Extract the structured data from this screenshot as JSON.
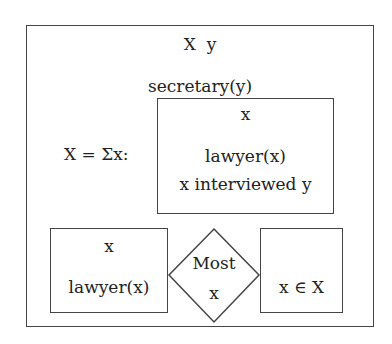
{
  "drs": {
    "universe": "X  y",
    "condition_secretary": "secretary(y)",
    "sum_label": "X = Σx:",
    "inner_box": {
      "universe": "x",
      "conditions": [
        "lawyer(x)",
        "x interviewed y"
      ]
    },
    "duplex": {
      "restrictor": {
        "universe": "x",
        "condition": "lawyer(x)"
      },
      "quantifier": {
        "label": "Most",
        "variable": "x"
      },
      "scope": {
        "condition": "x ∈ X"
      }
    }
  }
}
